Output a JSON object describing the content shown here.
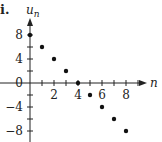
{
  "chart_data": {
    "type": "scatter",
    "panel_label": "i.",
    "title": "",
    "xlabel": "n",
    "ylabel": "u_n",
    "x": [
      0,
      1,
      2,
      3,
      4,
      5,
      6,
      7,
      8
    ],
    "y": [
      8,
      6,
      4,
      2,
      0,
      -2,
      -4,
      -6,
      -8
    ],
    "xticks": [
      1,
      2,
      3,
      4,
      5,
      6,
      7,
      8,
      9
    ],
    "xtick_labels": [
      "2",
      "4",
      "6",
      "8"
    ],
    "xtick_label_values": [
      2,
      4,
      6,
      8
    ],
    "yticks": [
      -8,
      -6,
      -4,
      -2,
      2,
      4,
      6,
      8
    ],
    "ytick_labels": [
      "8",
      "4",
      "0",
      "-4",
      "-8"
    ],
    "ytick_label_values": [
      8,
      4,
      0,
      -4,
      -8
    ],
    "xlim": [
      0,
      9.5
    ],
    "ylim": [
      -10,
      10.5
    ],
    "grid": false,
    "legend": null
  },
  "labels": {
    "panel": "i.",
    "y_axis_main": "u",
    "y_axis_sub": "n",
    "x_axis": "n",
    "x_ticks": [
      "2",
      "4",
      "6",
      "8"
    ],
    "y_ticks": [
      "8",
      "4",
      "0",
      "−4",
      "−8"
    ]
  }
}
